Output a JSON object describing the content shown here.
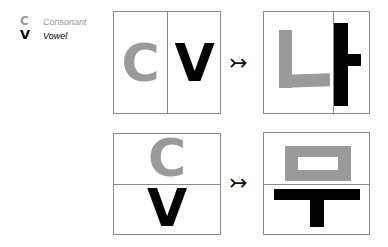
{
  "legend": {
    "items": [
      {
        "letter": "C",
        "label": "Consonant",
        "color": "#9a9a9a"
      },
      {
        "letter": "V",
        "label": "Vowel",
        "color": "#000000"
      }
    ]
  },
  "rows": [
    {
      "layout": "horizontal",
      "input": {
        "first": "C",
        "second": "V"
      },
      "arrow": "↣",
      "output": {
        "syllable": "나",
        "consonant": "ㄴ",
        "vowel": "ㅏ"
      }
    },
    {
      "layout": "vertical",
      "input": {
        "first": "C",
        "second": "V"
      },
      "arrow": "↣",
      "output": {
        "syllable": "무",
        "consonant": "ㅁ",
        "vowel": "ㅜ"
      }
    }
  ],
  "colors": {
    "consonant": "#9a9a9a",
    "vowel": "#000000",
    "border": "#8a8a8a"
  }
}
